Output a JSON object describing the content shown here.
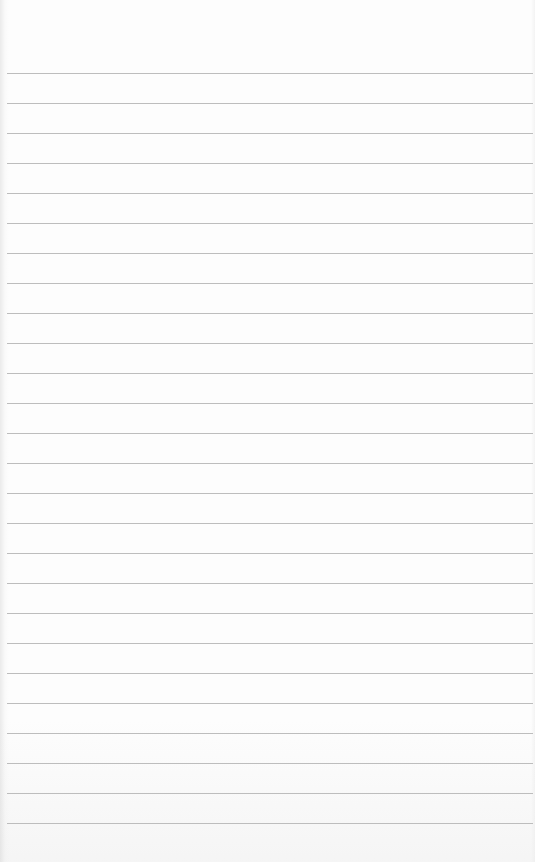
{
  "notepad": {
    "type": "ruled-paper",
    "content_text": "",
    "rules": {
      "count": 26,
      "first_y": 73,
      "spacing": 30,
      "color": "#bdbdbd"
    },
    "paper_color": "#fdfdfd"
  }
}
